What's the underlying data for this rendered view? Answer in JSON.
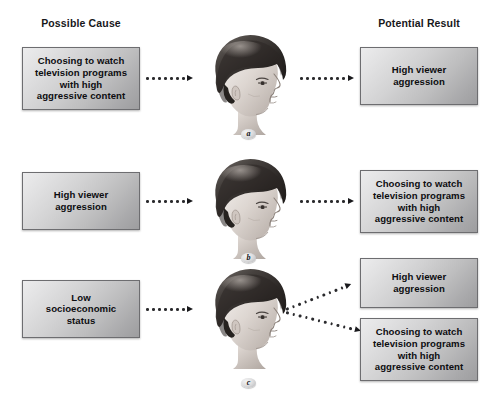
{
  "figure": {
    "type": "causal-direction-diagram",
    "headers": {
      "cause": "Possible Cause",
      "result": "Potential Result"
    },
    "concepts": {
      "tv": "Choosing to watch\ntelevision programs\nwith high\naggressive content",
      "aggression": "High viewer\naggression",
      "ses": "Low\nsocioeconomic\nstatus"
    },
    "rows": [
      {
        "id": "a",
        "label": "a",
        "cause": "Choosing to watch\ntelevision programs\nwith high\naggressive content",
        "results": [
          "High viewer\naggression"
        ],
        "arrows": 2,
        "icon": "child-head-profile"
      },
      {
        "id": "b",
        "label": "b",
        "cause": "High viewer\naggression",
        "results": [
          "Choosing to watch\ntelevision programs\nwith high\naggressive content"
        ],
        "arrows": 2,
        "icon": "child-head-profile"
      },
      {
        "id": "c",
        "label": "c",
        "cause": "Low\nsocioeconomic\nstatus",
        "results": [
          "High viewer\naggression",
          "Choosing to watch\ntelevision programs\nwith high\naggressive content"
        ],
        "arrows": 3,
        "icon": "child-head-profile"
      }
    ],
    "colors": {
      "box_light": "#ececed",
      "box_dark": "#9d9d9f",
      "box_border": "#6d6d70",
      "text": "#0d0d10",
      "arrow": "#2a2a2d",
      "background": "#ffffff"
    }
  }
}
